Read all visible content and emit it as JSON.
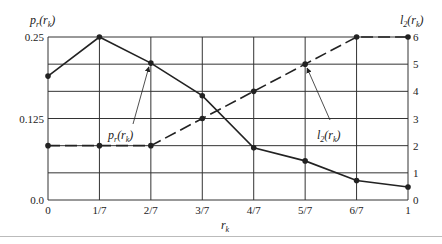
{
  "chart_data": {
    "type": "line",
    "title": "",
    "xlabel": "r_k",
    "ylabel": "p_r(r_k)",
    "ylabel_right": "l_2(r_k)",
    "categories": [
      "0",
      "1/7",
      "2/7",
      "3/7",
      "4/7",
      "5/7",
      "6/7",
      "1"
    ],
    "series": [
      {
        "name": "p_r(r_k)",
        "axis": "left",
        "style": "solid",
        "values": [
          0.19,
          0.25,
          0.21,
          0.16,
          0.08,
          0.06,
          0.03,
          0.02
        ]
      },
      {
        "name": "l_2(r_k)",
        "axis": "right",
        "style": "dashed",
        "values": [
          2,
          2,
          2,
          3,
          4,
          5,
          6,
          6
        ]
      }
    ],
    "ylim": [
      0,
      0.25
    ],
    "ylim_right": [
      0,
      6
    ],
    "left_ticks": [
      "0.0",
      "0.125",
      "0.25"
    ],
    "right_ticks": [
      "0",
      "1",
      "2",
      "3",
      "4",
      "5",
      "6"
    ],
    "grid": true,
    "annotations": [
      {
        "text": "p_r(r_k)",
        "points_to": "2/7"
      },
      {
        "text": "l_2(r_k)",
        "points_to": "5/7"
      }
    ]
  },
  "labels": {
    "left_axis_title": "p",
    "left_axis_title_sub": "r",
    "right_axis_title": "l",
    "right_axis_title_sub": "2",
    "x_axis_title": "r",
    "x_axis_title_sub": "k"
  }
}
